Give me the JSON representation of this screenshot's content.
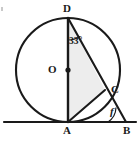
{
  "figure": {
    "kind": "circle-geometry-diagram",
    "width": 139,
    "height": 141,
    "background_color": "#ffffff",
    "stroke_color": "#1a1a1a",
    "shade_color": "#eeeeee"
  },
  "labels": {
    "center": "O",
    "top": "D",
    "right": "C",
    "bottom": "A",
    "tangent_end": "B"
  },
  "angles": {
    "at_d": "33°",
    "at_b": "f"
  },
  "geometry": {
    "circle": {
      "cx": 68,
      "cy": 70,
      "r": 52
    },
    "points": {
      "D": {
        "x": 68,
        "y": 18
      },
      "O": {
        "x": 68,
        "y": 70
      },
      "C": {
        "x": 105,
        "y": 90
      },
      "A": {
        "x": 68,
        "y": 122
      },
      "B": {
        "x": 126,
        "y": 122
      }
    },
    "baseline": {
      "x1": 4,
      "y1": 122,
      "x2": 136,
      "y2": 122
    },
    "segments": [
      "D-A",
      "D-C",
      "C-B",
      "A-C",
      "A-B"
    ],
    "shaded_region": "D-A-C"
  }
}
